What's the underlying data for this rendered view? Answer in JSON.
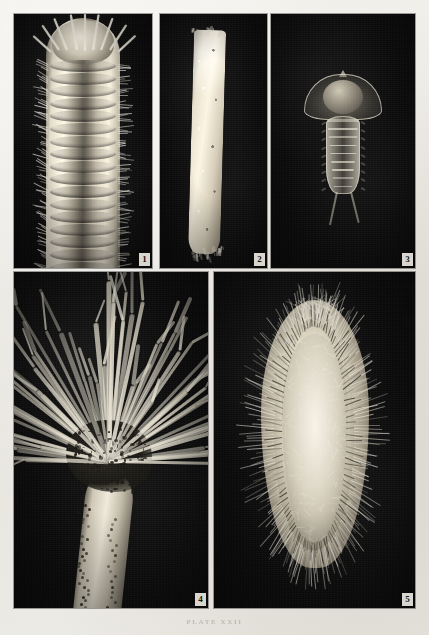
{
  "page": {
    "type": "book-plate",
    "caption": "PLATE  XXII",
    "background_color": "#e9e7e2",
    "panel_background_color": "#0d0d0d",
    "figure_count": 5
  },
  "figures": [
    {
      "number": "1",
      "name": "polychaete-anterior-dorsal",
      "description": "Dorsal view of the anterior end of a segmented bristle worm showing the head with long antennae and paired parapodia bearing chaetae along each segment"
    },
    {
      "number": "2",
      "name": "worm-tube",
      "description": "A slender sand-grain encrusted worm tube, slightly tapering, with a frayed lower opening"
    },
    {
      "number": "3",
      "name": "polychaete-larva",
      "description": "Free-swimming polychaete larva with a broad bell-shaped hood over a rounded dome, a segmented trunk and two long trailing caudal cirri"
    },
    {
      "number": "4",
      "name": "terebellid-worm-tentacles",
      "description": "Terebellid worm with its thick trunk curving upward into a dense dark crown from which numerous long pale grooved feeding tentacles radiate"
    },
    {
      "number": "5",
      "name": "sea-mouse-aphrodita",
      "description": "Dorsal view of a sea mouse (Aphrodita), an oval bodied scale worm covered with a dense felt of fine hairs and fringed with iridescent lateral bristles"
    }
  ]
}
